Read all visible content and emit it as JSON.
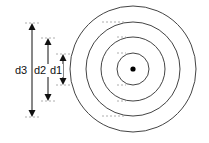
{
  "diagram": {
    "type": "concentric-circles",
    "center": {
      "x": 133,
      "y": 69
    },
    "circles": [
      {
        "name": "ring-1",
        "r": 16
      },
      {
        "name": "ring-2",
        "r": 32
      },
      {
        "name": "ring-3",
        "r": 47
      },
      {
        "name": "ring-4",
        "r": 63
      }
    ],
    "dimensions": [
      {
        "label": "d3",
        "x": 32,
        "y1": 23,
        "y2": 117,
        "label_x": 14
      },
      {
        "label": "d2",
        "x": 48,
        "y1": 38,
        "y2": 101,
        "label_x": 34
      },
      {
        "label": "d1",
        "x": 63,
        "y1": 54,
        "y2": 85,
        "label_x": 51
      }
    ],
    "colors": {
      "line": "#333333",
      "dot": "#000000",
      "background": "#ffffff"
    }
  }
}
